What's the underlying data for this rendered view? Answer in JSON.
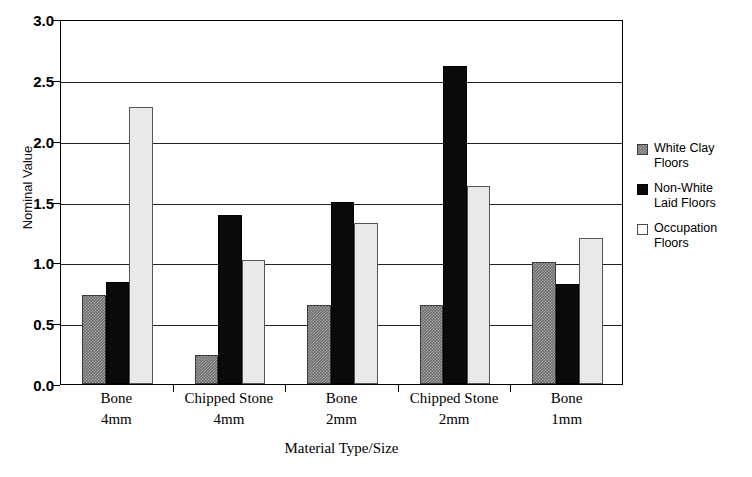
{
  "chart_data": {
    "type": "bar",
    "title": "",
    "xlabel": "Material Type/Size",
    "ylabel": "Nominal Value",
    "ylim": [
      0,
      3.0
    ],
    "ytick_step": 0.5,
    "yticks": [
      "0.0",
      "0.5",
      "1.0",
      "1.5",
      "2.0",
      "2.5",
      "3.0"
    ],
    "grid": true,
    "legend_position": "right",
    "categories": [
      "Bone 4mm",
      "Chipped Stone 4mm",
      "Bone 2mm",
      "Chipped Stone 2mm",
      "Bone 1mm"
    ],
    "category_lines": [
      {
        "name": "Bone",
        "size": "4mm"
      },
      {
        "name": "Chipped Stone",
        "size": "4mm"
      },
      {
        "name": "Bone",
        "size": "2mm"
      },
      {
        "name": "Chipped Stone",
        "size": "2mm"
      },
      {
        "name": "Bone",
        "size": "1mm"
      }
    ],
    "series": [
      {
        "name": "White Clay Floors",
        "legend_line1": "White Clay",
        "legend_line2": "Floors",
        "color": "#6e6e6e",
        "values": [
          0.73,
          0.24,
          0.65,
          0.65,
          1.0
        ]
      },
      {
        "name": "Non-White Laid Floors",
        "legend_line1": "Non-White",
        "legend_line2": "Laid Floors",
        "color": "#0a0a0a",
        "values": [
          0.84,
          1.39,
          1.5,
          2.61,
          0.82
        ]
      },
      {
        "name": "Occupation Floors",
        "legend_line1": "Occupation",
        "legend_line2": "Floors",
        "color": "#e9e9e9",
        "values": [
          2.28,
          1.02,
          1.32,
          1.63,
          1.2
        ]
      }
    ]
  }
}
